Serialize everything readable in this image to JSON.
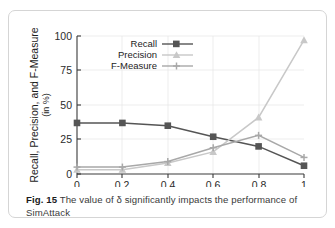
{
  "figure": {
    "caption_label": "Fig. 15",
    "caption_text": " The value of δ significantly impacts the performance of",
    "caption_text_line2": "SimAttack"
  },
  "chart_data": {
    "type": "line",
    "title": "",
    "xlabel": "Threshold  δ",
    "ylabel": "Recall, Precision, and F-Measure",
    "ylabel_sub": "(in %)",
    "x": [
      0,
      0.2,
      0.4,
      0.6,
      0.8,
      1
    ],
    "xtick_labels": [
      "0",
      "0.2",
      "0.4",
      "0.6",
      "0.8",
      "1"
    ],
    "ytick_labels": [
      "0",
      "25",
      "50",
      "75",
      "100"
    ],
    "yticks": [
      0,
      25,
      50,
      75,
      100
    ],
    "xlim": [
      0,
      1
    ],
    "ylim": [
      0,
      100
    ],
    "grid": true,
    "legend_position": "upper-left-inside",
    "series": [
      {
        "name": "Recall",
        "values": [
          37,
          37,
          35,
          27,
          20,
          6
        ],
        "color": "#555555",
        "marker": "square"
      },
      {
        "name": "Precision",
        "values": [
          3,
          3,
          8,
          16,
          41,
          97
        ],
        "color": "#c8c8c8",
        "marker": "triangle"
      },
      {
        "name": "F-Measure",
        "values": [
          5,
          5,
          9,
          19,
          28,
          12
        ],
        "color": "#a8a8a8",
        "marker": "cross"
      }
    ]
  }
}
